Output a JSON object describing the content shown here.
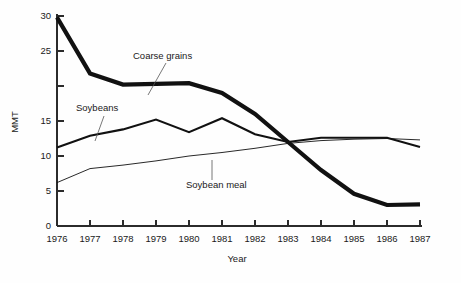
{
  "chart_data": {
    "type": "line",
    "title": "",
    "xlabel": "Year",
    "ylabel": "MMT",
    "x": [
      1976,
      1977,
      1978,
      1979,
      1980,
      1981,
      1982,
      1983,
      1984,
      1985,
      1986,
      1987
    ],
    "xtick_labels": [
      "1976",
      "1977",
      "1978",
      "1979",
      "1980",
      "1981",
      "1982",
      "1983",
      "1984",
      "1985",
      "1986",
      "1987"
    ],
    "xlim": [
      1976,
      1987
    ],
    "ylim": [
      0,
      30
    ],
    "ytick_values": [
      0,
      5,
      10,
      15,
      20,
      25,
      30
    ],
    "ytick_labels": [
      "0",
      "5",
      "10",
      "15",
      "",
      "25",
      "30"
    ],
    "grid": false,
    "legend_position": "inline-annotations",
    "series": [
      {
        "name": "Coarse grains",
        "style": "thick",
        "values": [
          29.8,
          21.8,
          20.2,
          20.3,
          20.4,
          19.0,
          16.0,
          12.0,
          8.0,
          4.6,
          3.0,
          3.1
        ]
      },
      {
        "name": "Soybeans",
        "style": "medium",
        "values": [
          11.2,
          12.9,
          13.8,
          15.2,
          13.4,
          15.4,
          13.1,
          12.0,
          12.6,
          12.6,
          12.6,
          11.3
        ]
      },
      {
        "name": "Soybean meal",
        "style": "thin",
        "values": [
          6.2,
          8.2,
          8.7,
          9.3,
          10.0,
          10.5,
          11.1,
          11.8,
          12.2,
          12.4,
          12.5,
          12.3
        ]
      }
    ],
    "annotations": [
      {
        "label": "Coarse grains",
        "text_x": 133,
        "text_y": 59,
        "leader": [
          166,
          63,
          148,
          95
        ]
      },
      {
        "label": "Soybeans",
        "text_x": 76,
        "text_y": 111,
        "leader": [
          104,
          116,
          95,
          141
        ]
      },
      {
        "label": "Soybean meal",
        "text_x": 186,
        "text_y": 188,
        "leader": [
          212,
          180,
          212,
          160
        ]
      }
    ],
    "colors": {
      "line": "#111111",
      "axis": "#2b2b2b",
      "background": "#ffffff",
      "leader": "#555555"
    }
  }
}
